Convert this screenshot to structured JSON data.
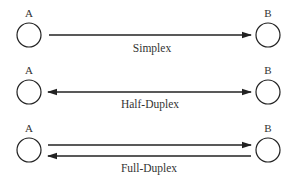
{
  "diagram": {
    "colors": {
      "stroke": "#222222",
      "text": "#333333",
      "background": "#ffffff"
    },
    "node_labels": {
      "left": "A",
      "right": "B"
    },
    "modes": [
      {
        "name": "Simplex",
        "direction": "A→B",
        "arrows": [
          "right"
        ]
      },
      {
        "name": "Half-Duplex",
        "direction": "A↔B",
        "arrows": [
          "both"
        ]
      },
      {
        "name": "Full-Duplex",
        "direction": "A→B and B→A",
        "arrows": [
          "right",
          "left"
        ]
      }
    ]
  }
}
